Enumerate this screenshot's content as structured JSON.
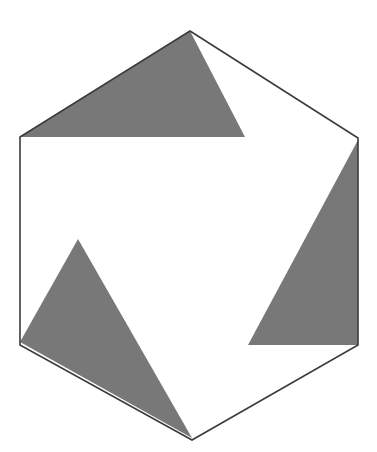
{
  "figure": {
    "title_fragment": "g",
    "canvas": {
      "width": 377,
      "height": 452
    },
    "colors": {
      "background": "#ffffff",
      "triangle_fill": "#787878",
      "outline_stroke": "#3c3c3c",
      "text": "#1a1a1a"
    },
    "outline": {
      "name": "hexagon",
      "stroke_width": 1.6,
      "fill": "none",
      "points": "190,31 358,138 358,345 192,440 20,345 20,137"
    },
    "shapes": [
      {
        "name": "top-triangle",
        "fill": "#787878",
        "points": "20,137 190,31 245,137"
      },
      {
        "name": "right-triangle",
        "fill": "#787878",
        "points": "358,140 358,345 248,345"
      },
      {
        "name": "bottom-left-triangle",
        "fill": "#787878",
        "points": "20,342 78,239 192,438"
      }
    ]
  }
}
